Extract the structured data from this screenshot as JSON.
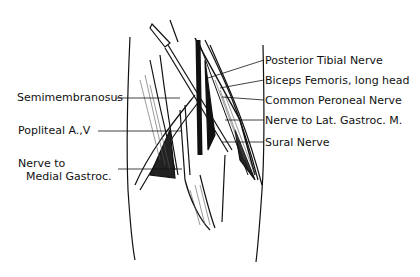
{
  "figure": {
    "labels_right": [
      {
        "text": "Posterior Tibial Nerve",
        "x": 265,
        "y": 54
      },
      {
        "text": "Biceps Femoris, long head",
        "x": 265,
        "y": 74
      },
      {
        "text": "Common Peroneal Nerve",
        "x": 265,
        "y": 94
      },
      {
        "text": "Nerve to Lat. Gastroc. M.",
        "x": 265,
        "y": 114
      },
      {
        "text": "Sural Nerve",
        "x": 265,
        "y": 136
      }
    ],
    "labels_left": [
      {
        "text": "Semimembranosus",
        "x": 17,
        "y": 91
      },
      {
        "text": "Popliteal A.,V",
        "x": 18,
        "y": 124
      },
      {
        "text": "Nerve to",
        "x": 18,
        "y": 157
      },
      {
        "text": "Medial Gastroc.",
        "x": 26,
        "y": 170
      }
    ]
  }
}
